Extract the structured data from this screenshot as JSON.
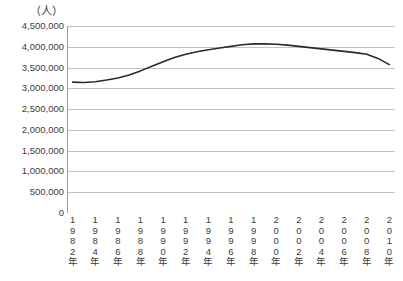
{
  "chart_data": {
    "type": "line",
    "title": "",
    "subtitle": "",
    "unit_label": "（人）",
    "xlabel": "",
    "ylabel": "",
    "ylim": [
      0,
      4500000
    ],
    "y_ticks": [
      "4,500,000",
      "4,000,000",
      "3,500,000",
      "3,000,000",
      "2,500,000",
      "2,000,000",
      "1,500,000",
      "1,000,000",
      "500,000",
      "0"
    ],
    "y_tick_values": [
      4500000,
      4000000,
      3500000,
      3000000,
      2500000,
      2000000,
      1500000,
      1000000,
      500000,
      0
    ],
    "grid": true,
    "legend": "none",
    "x_tick_labels": [
      "1982年",
      "1984年",
      "1986年",
      "1988年",
      "1990年",
      "1992年",
      "1994年",
      "1996年",
      "1998年",
      "2000年",
      "2002年",
      "2004年",
      "2006年",
      "2008年",
      "2010年"
    ],
    "x": [
      1982,
      1983,
      1984,
      1985,
      1986,
      1987,
      1988,
      1989,
      1990,
      1991,
      1992,
      1993,
      1994,
      1995,
      1996,
      1997,
      1998,
      1999,
      2000,
      2001,
      2002,
      2003,
      2004,
      2005,
      2006,
      2007,
      2008,
      2009,
      2010
    ],
    "values": [
      3150000,
      3140000,
      3160000,
      3200000,
      3250000,
      3320000,
      3420000,
      3530000,
      3640000,
      3740000,
      3820000,
      3880000,
      3930000,
      3970000,
      4010000,
      4050000,
      4070000,
      4070000,
      4060000,
      4040000,
      4010000,
      3980000,
      3950000,
      3920000,
      3890000,
      3860000,
      3820000,
      3720000,
      3570000
    ],
    "series": [
      {
        "name": "人口",
        "color": "#2b2b22",
        "values": [
          3150000,
          3140000,
          3160000,
          3200000,
          3250000,
          3320000,
          3420000,
          3530000,
          3640000,
          3740000,
          3820000,
          3880000,
          3930000,
          3970000,
          4010000,
          4050000,
          4070000,
          4070000,
          4060000,
          4040000,
          4010000,
          3980000,
          3950000,
          3920000,
          3890000,
          3860000,
          3820000,
          3720000,
          3570000
        ]
      }
    ],
    "colors": {
      "line": "#2b2b22",
      "grid": "#b4b4ac",
      "axis": "#9a9a92",
      "text": "#3c3c3c",
      "background": "#ffffff"
    }
  }
}
